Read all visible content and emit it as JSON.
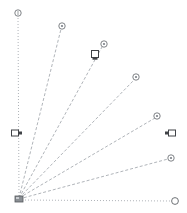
{
  "canvas": {
    "width": 187,
    "height": 213,
    "background": "#ffffff",
    "title": "Radial fan line diagram"
  },
  "style": {
    "axis_color": "#9aa0a6",
    "ray_color": "#8e949b",
    "marker_stroke": "#5f6368",
    "marker_fill": "#ffffff",
    "handle_stroke": "#404347",
    "handle_fill": "#ffffff",
    "origin_color": "#6e7277",
    "axis_dash": "1,2",
    "ray_dash": "3,2",
    "axis_width": 0.8,
    "ray_width": 0.7
  },
  "origin": {
    "label": "origin",
    "x": 19,
    "y": 199
  },
  "axes": [
    {
      "name": "vertical-axis",
      "orientation": "vertical",
      "x1": 19,
      "y1": 199,
      "x2": 18,
      "y2": 16,
      "endpoint_marker": "circle",
      "endpoint_x": 18,
      "endpoint_y": 13,
      "endpoint_r": 3.2
    },
    {
      "name": "horizontal-axis",
      "orientation": "horizontal",
      "x1": 19,
      "y1": 200,
      "x2": 171,
      "y2": 201,
      "endpoint_marker": "circle",
      "endpoint_x": 175,
      "endpoint_y": 201,
      "endpoint_r": 3.4
    }
  ],
  "rays": [
    {
      "name": "ray-1",
      "index": 1,
      "x1": 19,
      "y1": 198,
      "x2": 61,
      "y2": 29,
      "endpoint_x": 62,
      "endpoint_y": 26,
      "endpoint_r": 3.2,
      "endpoint_marker": "circle-dot"
    },
    {
      "name": "ray-2",
      "index": 2,
      "x1": 19,
      "y1": 198,
      "x2": 102,
      "y2": 47,
      "endpoint_x": 104,
      "endpoint_y": 44,
      "endpoint_r": 3.2,
      "endpoint_marker": "circle-dot"
    },
    {
      "name": "ray-3",
      "index": 3,
      "x1": 19,
      "y1": 198,
      "x2": 134,
      "y2": 80,
      "endpoint_x": 136,
      "endpoint_y": 77,
      "endpoint_r": 3.2,
      "endpoint_marker": "circle-dot"
    },
    {
      "name": "ray-4",
      "index": 4,
      "x1": 19,
      "y1": 198,
      "x2": 155,
      "y2": 118,
      "endpoint_x": 157,
      "endpoint_y": 116,
      "endpoint_r": 3.2,
      "endpoint_marker": "circle-dot"
    },
    {
      "name": "ray-5",
      "index": 5,
      "x1": 19,
      "y1": 199,
      "x2": 168,
      "y2": 159,
      "endpoint_x": 171,
      "endpoint_y": 158,
      "endpoint_r": 3.2,
      "endpoint_marker": "circle-dot"
    }
  ],
  "handles": [
    {
      "name": "handle-left",
      "position": "left-mid",
      "x": 15,
      "y": 133,
      "w": 7,
      "h": 6,
      "tick_side": "right"
    },
    {
      "name": "handle-right",
      "position": "right-mid",
      "x": 172,
      "y": 133,
      "w": 7,
      "h": 6,
      "tick_side": "left"
    },
    {
      "name": "handle-ray-2",
      "position": "on-ray-2",
      "x": 95,
      "y": 54,
      "w": 7,
      "h": 7,
      "tick_side": "bottom"
    }
  ],
  "origin_cluster": {
    "name": "origin-node",
    "x": 19,
    "y": 199,
    "w": 8,
    "h": 6
  }
}
